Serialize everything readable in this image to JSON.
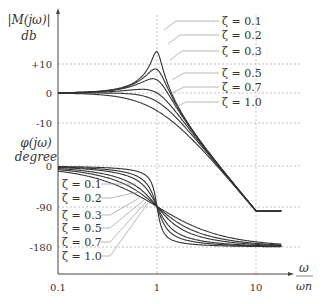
{
  "chart_data": [
    {
      "type": "line",
      "title": "Bode magnitude plot of second-order system",
      "ylabel": "|M(jω)| db",
      "xlabel": "ω/ω_n",
      "xscale": "log",
      "xlim": [
        0.1,
        20
      ],
      "ylim": [
        -13,
        20
      ],
      "yticks": [
        "+10",
        "0",
        "-10"
      ],
      "ytick_values": [
        10,
        0,
        -10
      ],
      "xticks": [
        "0.1",
        "1",
        "10"
      ],
      "grid": true,
      "series": [
        {
          "name": "ζ = 0.1",
          "zeta": 0.1,
          "peak_db": 14
        },
        {
          "name": "ζ = 0.2",
          "zeta": 0.2,
          "peak_db": 8
        },
        {
          "name": "ζ = 0.3",
          "zeta": 0.3,
          "peak_db": 4.4
        },
        {
          "name": "ζ = 0.5",
          "zeta": 0.5,
          "peak_db": 1.2
        },
        {
          "name": "ζ = 0.7",
          "zeta": 0.7,
          "peak_db": 0
        },
        {
          "name": "ζ = 1.0",
          "zeta": 1.0,
          "peak_db": 0
        }
      ]
    },
    {
      "type": "line",
      "title": "Bode phase plot of second-order system",
      "ylabel": "φ(jω) degree",
      "xlabel": "ω/ω_n",
      "xscale": "log",
      "xlim": [
        0.1,
        20
      ],
      "ylim": [
        -200,
        0
      ],
      "yticks": [
        "0",
        "-90",
        "-180"
      ],
      "ytick_values": [
        0,
        -90,
        -180
      ],
      "xticks": [
        "0.1",
        "1",
        "10"
      ],
      "grid": true,
      "series": [
        {
          "name": "ζ = 0.1",
          "zeta": 0.1
        },
        {
          "name": "ζ = 0.2",
          "zeta": 0.2
        },
        {
          "name": "ζ = 0.3",
          "zeta": 0.3
        },
        {
          "name": "ζ = 0.5",
          "zeta": 0.5
        },
        {
          "name": "ζ = 0.7",
          "zeta": 0.7
        },
        {
          "name": "ζ = 1.0",
          "zeta": 1.0
        }
      ]
    }
  ],
  "labels": {
    "mag_axis_top": "|M(jω)|",
    "mag_axis_bottom": "db",
    "phase_axis_top": "φ(jω)",
    "phase_axis_bottom": "degree",
    "x_axis_num": "ω",
    "x_axis_den": "ωn",
    "mag_ticks": [
      "+10",
      "0",
      "-10"
    ],
    "phase_ticks": [
      "0",
      "-90",
      "-180"
    ],
    "x_ticks": [
      "0.1",
      "1",
      "10"
    ],
    "zeta_labels": [
      "ζ = 0.1",
      "ζ = 0.2",
      "ζ = 0.3",
      "ζ = 0.5",
      "ζ = 0.7",
      "ζ = 1.0"
    ]
  },
  "colors": {
    "curve": "#333333",
    "grid": "#999999",
    "axis": "#444444",
    "leader": "#888888"
  }
}
